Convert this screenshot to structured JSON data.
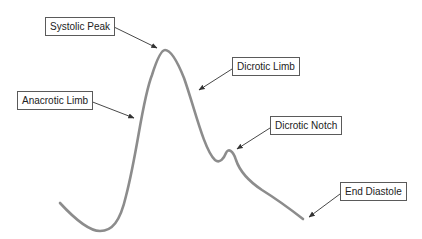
{
  "diagram": {
    "type": "arterial-pressure-waveform",
    "curve_color": "#8c8c8c",
    "arrow_color": "#333333",
    "box_border_color": "#5a5a5a",
    "labels": [
      {
        "id": "systolic-peak",
        "text": "Systolic Peak"
      },
      {
        "id": "dicrotic-limb",
        "text": "Dicrotic Limb"
      },
      {
        "id": "anacrotic-limb",
        "text": "Anacrotic Limb"
      },
      {
        "id": "dicrotic-notch",
        "text": "Dicrotic Notch"
      },
      {
        "id": "end-diastole",
        "text": "End Diastole"
      }
    ]
  }
}
